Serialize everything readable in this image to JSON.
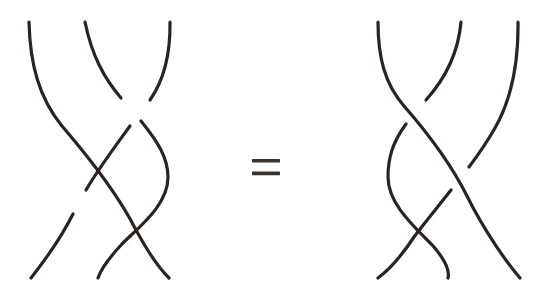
{
  "figure": {
    "type": "braid-relation-diagram",
    "background_color": "#ffffff",
    "stroke_color": "#2b2320",
    "stroke_width": 3.2,
    "width": 554,
    "height": 300
  },
  "equals_sign": {
    "label": "=",
    "name": "equals-sign",
    "color": "#3a3430",
    "x": 252,
    "y": 159,
    "bar_width": 28,
    "bar_height": 3.6,
    "bar_gap": 9
  },
  "left_braid": {
    "name": "left-braid",
    "strand_count": 3,
    "top_endpoints_x": [
      29,
      85,
      170
    ],
    "bottom_endpoints_x": [
      30,
      98,
      169
    ],
    "top_y": 22,
    "bottom_y": 278,
    "crossing_count": 3,
    "strands": [
      {
        "id": "L1",
        "name": "left-strand-1",
        "path": "M 29 22 C 31 62 40 96 62 124 C 84 152 118 196 136 232 C 148 256 160 270 169 278",
        "over": true,
        "segments": [
          "M 29 22 C 31 62 40 96 62 124 C 84 152 118 196 136 232 C 148 256 160 270 169 278"
        ]
      },
      {
        "id": "L2",
        "name": "left-strand-2",
        "path": "M 85 22 C 92 58 108 84 130 108 C 152 132 168 154 168 176 C 168 206 136 230 118 250 C 106 264 100 272 98 278",
        "over": false,
        "segments": [
          "M 85 22 C 92 58 106 82 124 102",
          "M 140 120 C 158 140 168 157 168 176 C 168 206 136 230 118 250 C 106 264 100 272 98 278"
        ]
      },
      {
        "id": "L3",
        "name": "left-strand-3",
        "path": "M 170 22 C 170 56 162 82 146 104 C 128 128 100 160 80 196 C 60 232 40 262 30 278",
        "over": false,
        "segments": [
          "M 170 22 C 170 56 162 82 148 100",
          "M 130 124 C 112 148 96 170 82 194 C 62 230 40 262 30 278"
        ]
      }
    ]
  },
  "right_braid": {
    "name": "right-braid",
    "strand_count": 3,
    "top_endpoints_x": [
      378,
      461,
      518
    ],
    "bottom_endpoints_x": [
      378,
      448,
      520
    ],
    "top_y": 22,
    "bottom_y": 278,
    "crossing_count": 3,
    "strands": [
      {
        "id": "R1",
        "name": "right-strand-1",
        "path": "M 378 22 C 378 58 386 84 404 106 C 424 130 448 160 466 196 C 484 232 506 262 520 278",
        "over": true,
        "segments": [
          "M 378 22 C 378 58 386 84 404 106 C 424 130 448 160 466 196 C 484 232 506 262 520 278"
        ]
      },
      {
        "id": "R2",
        "name": "right-strand-2",
        "path": "M 461 22 C 458 58 442 84 422 106 C 402 130 388 152 388 176 C 388 206 418 232 436 252 C 446 264 450 272 448 278",
        "over": false,
        "segments": [
          "M 461 22 C 458 58 442 84 424 104",
          "M 406 124 C 392 144 388 158 388 176 C 388 206 418 232 436 252 C 446 264 450 272 448 278"
        ]
      },
      {
        "id": "R3",
        "name": "right-strand-3",
        "path": "M 518 22 C 518 62 512 98 494 130 C 474 164 438 200 418 232 C 404 256 392 270 378 278",
        "over": false,
        "segments": [
          "M 518 22 C 518 62 512 98 496 128 C 488 142 478 156 468 168",
          "M 450 188 C 436 206 424 220 414 236 C 400 258 390 270 378 278"
        ]
      }
    ]
  }
}
